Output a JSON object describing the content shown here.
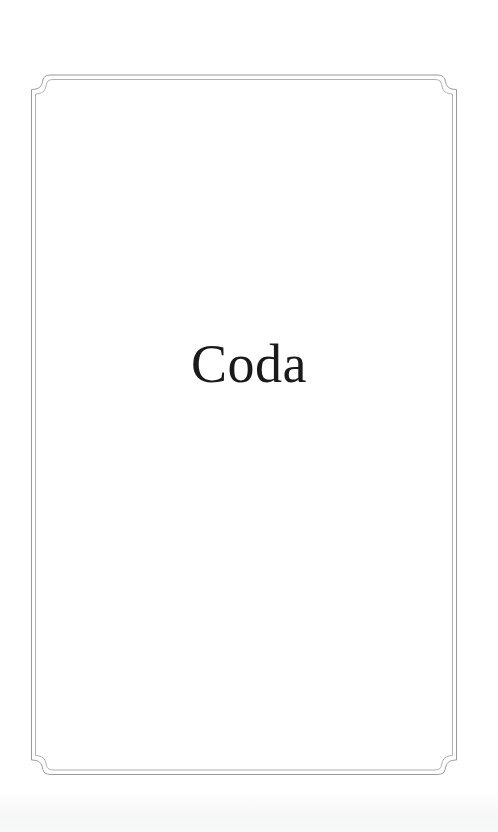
{
  "page": {
    "kind": "book-part-title-page",
    "background_color": "#ffffff",
    "width": 498,
    "height": 832
  },
  "frame": {
    "name": "decorative-double-rule-border",
    "style": "double-rule with ogee bracket corners",
    "outer_stroke_color": "#9a9a9a",
    "inner_stroke_color": "#b0b0b0",
    "stroke_width": 1,
    "bounds": {
      "left": 31,
      "top": 75,
      "right": 457,
      "bottom": 774
    },
    "corner_style": "ogee"
  },
  "title": {
    "text": "Coda",
    "color": "#1a1a1a",
    "font_size_px": 54,
    "alignment": "center"
  },
  "scan": {
    "noise_color": "#eef0f1"
  }
}
